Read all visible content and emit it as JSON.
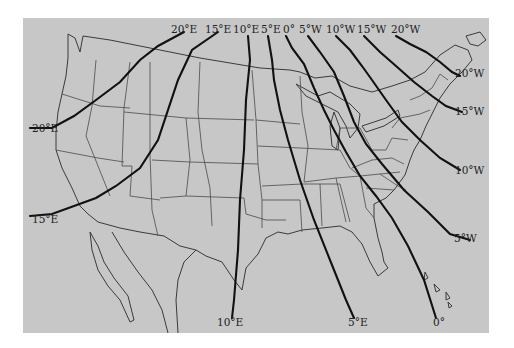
{
  "map": {
    "title": "",
    "subject": "Isogonic lines (magnetic declination) over the contiguous United States",
    "background_colors": {
      "page": "#ffffff",
      "map_area": "#c9c9c9",
      "land_light": "#dcdcdc",
      "line": "#111111"
    },
    "top_labels": [
      "20°E",
      "15°E",
      "10°E",
      "5°E",
      "0°",
      "5°W",
      "10°W",
      "15°W",
      "20°W"
    ],
    "left_labels": [
      "20°E",
      "15°E"
    ],
    "right_labels": [
      "20°W",
      "15°W",
      "10°W",
      "5°W"
    ],
    "bottom_labels": [
      "10°E",
      "5°E",
      "0°"
    ]
  },
  "isogonic_lines": [
    {
      "value": "20°E",
      "direction": "east"
    },
    {
      "value": "15°E",
      "direction": "east"
    },
    {
      "value": "10°E",
      "direction": "east"
    },
    {
      "value": "5°E",
      "direction": "east"
    },
    {
      "value": "0°",
      "direction": "agonic"
    },
    {
      "value": "5°W",
      "direction": "west"
    },
    {
      "value": "10°W",
      "direction": "west"
    },
    {
      "value": "15°W",
      "direction": "west"
    },
    {
      "value": "20°W",
      "direction": "west"
    }
  ]
}
